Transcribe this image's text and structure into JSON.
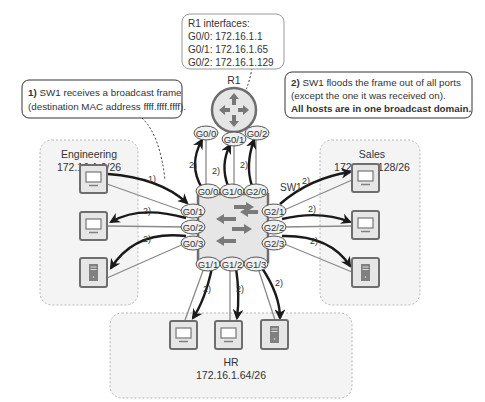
{
  "router": {
    "name": "R1",
    "info_title": "R1 interfaces:",
    "interfaces": [
      {
        "port": "G0/0",
        "ip": "172.16.1.1",
        "line": "G0/0: 172.16.1.1"
      },
      {
        "port": "G0/1",
        "ip": "172.16.1.65",
        "line": "G0/1: 172.16.1.65"
      },
      {
        "port": "G0/2",
        "ip": "172.16.1.129",
        "line": "G0/2: 172.16.1.129"
      }
    ],
    "ports": [
      "G0/0",
      "G0/1",
      "G0/2"
    ]
  },
  "switch": {
    "name": "SW1",
    "top_ports": [
      "G0/0",
      "G1/0",
      "G2/0"
    ],
    "left_ports": [
      "G0/1",
      "G0/2",
      "G0/3"
    ],
    "right_ports": [
      "G2/1",
      "G2/2",
      "G2/3"
    ],
    "bottom_ports": [
      "G1/1",
      "G1/2",
      "G1/3"
    ]
  },
  "callouts": {
    "step1": {
      "num": "1)",
      "line1": " SW1 receives a broadcast frame",
      "line2": "(destination MAC address ffff.ffff.ffff)."
    },
    "step2": {
      "num": "2)",
      "line1": " SW1 floods the frame out of all ports",
      "line2": "(except the one it was received on).",
      "line3": "All hosts are in one broadcast domain."
    }
  },
  "zones": {
    "engineering": {
      "name": "Engineering",
      "subnet": "172.16.1.0/26",
      "hosts": [
        "pc",
        "pc",
        "server"
      ]
    },
    "sales": {
      "name": "Sales",
      "subnet": "172.16.1.128/26",
      "hosts": [
        "pc",
        "pc",
        "server"
      ]
    },
    "hr": {
      "name": "HR",
      "subnet": "172.16.1.64/26",
      "hosts": [
        "pc",
        "pc",
        "server"
      ]
    }
  },
  "arrow_labels": {
    "step1": "1)",
    "step2": "2)"
  },
  "colors": {
    "arrow": "#1a1a1a",
    "link": "#8a8a8a",
    "zone_border": "#b5b5b5",
    "zone_fill": "#f4f4f4",
    "device_fill": "#e6e6e6",
    "device_border": "#6e6e6e",
    "icon": "#808080"
  }
}
